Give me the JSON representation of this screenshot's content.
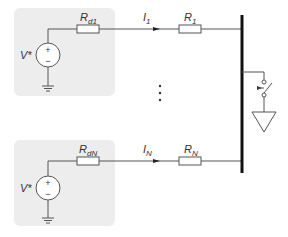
{
  "diagram": {
    "type": "circuit-schematic",
    "colors": {
      "background": "#ffffff",
      "source_box": "#ededed",
      "wire": "#555555",
      "bus": "#111111"
    },
    "branches": [
      {
        "id": "branch-1",
        "source_label": "V*",
        "internal_resistor": {
          "main": "R",
          "sub": "d1"
        },
        "current": {
          "main": "I",
          "sub": "1"
        },
        "line_resistor": {
          "main": "R",
          "sub": "1"
        }
      },
      {
        "id": "branch-N",
        "source_label": "V*",
        "internal_resistor": {
          "main": "R",
          "sub": "dN"
        },
        "current": {
          "main": "I",
          "sub": "N"
        },
        "line_resistor": {
          "main": "R",
          "sub": "N"
        }
      }
    ],
    "ellipsis": "⋮",
    "source_polarity": {
      "plus": "+",
      "minus": "−"
    },
    "bus": {
      "label": "common-bus"
    },
    "load": {
      "switch": "switch",
      "ground": "ground-triangle"
    }
  }
}
